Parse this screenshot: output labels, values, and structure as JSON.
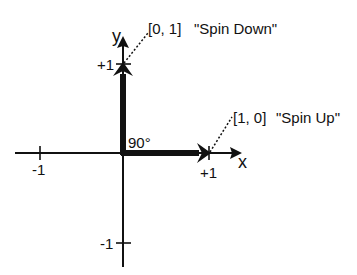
{
  "diagram": {
    "axes": {
      "x_label": "x",
      "y_label": "y",
      "ticks": {
        "x_pos": "+1",
        "x_neg": "-1",
        "y_pos": "+1",
        "y_neg": "-1"
      }
    },
    "angle_label": "90°",
    "vectors": [
      {
        "coords": "[0, 1]",
        "name": "\"Spin Down\"",
        "direction": "up"
      },
      {
        "coords": "[1, 0]",
        "name": "\"Spin Up\"",
        "direction": "right"
      }
    ],
    "colors": {
      "ink": "#111111",
      "background": "#ffffff"
    }
  }
}
